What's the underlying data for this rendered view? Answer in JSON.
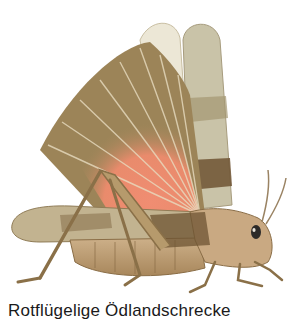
{
  "figure": {
    "caption": "Rotflügelige Ödlandschrecke",
    "colors": {
      "background": "#ffffff",
      "hindwing_red": "#ec8a6e",
      "wing_brown": "#9c8458",
      "wing_grey": "#c9c3a8",
      "body_tan": "#c8a77a",
      "dark_band": "#6e5433",
      "caption_text": "#1a1a1a"
    }
  }
}
